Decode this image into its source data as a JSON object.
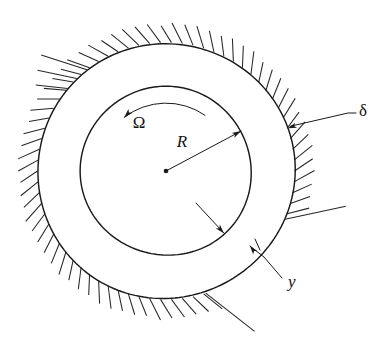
{
  "figure": {
    "background_color": "#ffffff",
    "line_color": "#1a1a1a",
    "hatch_color": "#262626"
  },
  "geometry": {
    "center": {
      "x": 166,
      "y": 171
    },
    "inner_circle_radius": 85,
    "outer_circle_radius": 128,
    "hatch": {
      "tick_length": 22,
      "tick_count": 74,
      "gap_start_deg": 22,
      "gap_end_deg": 66
    }
  },
  "labels": {
    "omega": {
      "text": "Ω",
      "name": "angular-velocity",
      "x": 139,
      "y": 128,
      "font_size": 18
    },
    "radius": {
      "text": "R",
      "name": "journal-radius",
      "x": 182,
      "y": 147,
      "font_size": 18
    },
    "delta": {
      "text": "δ",
      "name": "film-thickness",
      "x": 359,
      "y": 116,
      "font_size": 17
    },
    "y": {
      "text": "y",
      "name": "film-coordinate",
      "x": 288,
      "y": 287,
      "font_size": 17
    }
  },
  "annotations": {
    "rotation_arrow": {
      "name": "rotation-arrow",
      "direction": "counter-clockwise",
      "start_deg": 55,
      "end_deg": 128,
      "radius": 68
    },
    "radius_arrow": {
      "name": "radius-dimension-arrow",
      "from": {
        "x": 166,
        "y": 171
      },
      "to_angle_deg": 28,
      "to_radius": 85
    },
    "delta_leader": {
      "name": "delta-leader-line",
      "elbow": {
        "x": 348,
        "y": 113
      },
      "tip_angle_deg": 19,
      "tip_radius": 128
    },
    "y_leader": {
      "name": "y-leader-line",
      "elbow": {
        "x": 282,
        "y": 278
      },
      "cross_point": {
        "x": 264,
        "y": 257
      }
    },
    "inner_surface_arrow": {
      "name": "inner-surface-arrow",
      "tail": {
        "x": 196,
        "y": 203
      },
      "tip_angle_deg": -47,
      "tip_radius": 85
    }
  }
}
